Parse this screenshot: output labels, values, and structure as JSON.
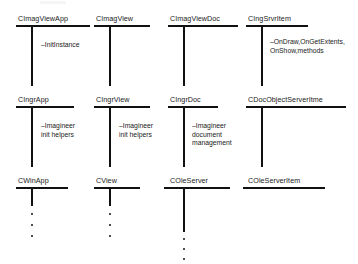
{
  "diagram": {
    "type": "class-hierarchy-diagram",
    "title": "",
    "ink_color": "#111111",
    "text_color": "#1a1a1a",
    "background": "#ffffff",
    "columns": [
      {
        "id": "col-app",
        "x": 16,
        "nodes": [
          {
            "id": "cimagviewapp",
            "label": "CImagViewApp",
            "row": 1
          },
          {
            "id": "cingrapp",
            "label": "CIngrApp",
            "row": 2
          },
          {
            "id": "cwinapp",
            "label": "CWinApp",
            "row": 3
          }
        ],
        "annotations": [
          {
            "id": "ann-initinstance",
            "text": "–InitInstance",
            "row": 1
          },
          {
            "id": "ann-init-helpers-app",
            "text": "–Imagineer\ninit helpers",
            "row": 2
          }
        ],
        "ellipsis_below": true
      },
      {
        "id": "col-view",
        "x": 94,
        "nodes": [
          {
            "id": "cimagview",
            "label": "CImagView",
            "row": 1
          },
          {
            "id": "cingrview",
            "label": "CIngrView",
            "row": 2
          },
          {
            "id": "cview",
            "label": "CView",
            "row": 3
          }
        ],
        "annotations": [
          {
            "id": "ann-init-helpers-view",
            "text": "–Imagineer\ninit helpers",
            "row": 2
          }
        ],
        "ellipsis_below": true
      },
      {
        "id": "col-doc",
        "x": 168,
        "nodes": [
          {
            "id": "cimagviewdoc",
            "label": "CImagViewDoc",
            "row": 1
          },
          {
            "id": "cingrdoc",
            "label": "CIngrDoc",
            "row": 2
          },
          {
            "id": "coleserver",
            "label": "COleServer",
            "row": 3
          }
        ],
        "annotations": [
          {
            "id": "ann-doc-management",
            "text": "–Imagineer\ndocument\nmanagement",
            "row": 2
          }
        ],
        "ellipsis_below": true
      },
      {
        "id": "col-item",
        "x": 247,
        "nodes": [
          {
            "id": "cingsrvritem",
            "label": "CIngSrvrItem",
            "row": 1
          },
          {
            "id": "cdocobjectserveritme",
            "label": "CDocObjectServerItme",
            "row": 2
          },
          {
            "id": "coleserveritem",
            "label": "COleServerItem",
            "row": 3
          }
        ],
        "annotations": [
          {
            "id": "ann-ondraw-methods",
            "text": "–OnDraw,OnGetExtents,\n  OnShow,methods",
            "row": 1
          }
        ],
        "ellipsis_below": false
      }
    ]
  }
}
